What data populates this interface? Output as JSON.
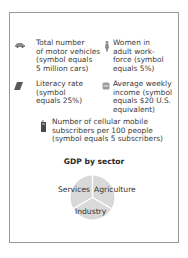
{
  "legend": {
    "items": [
      {
        "icon": "car-icon",
        "text": "Total number\nof motor vehicles\n(symbol equals\n5 million cars)"
      },
      {
        "icon": "woman-icon",
        "text": "Women in\nadult work-\nforce (symbol\nequals 5%)"
      },
      {
        "icon": "book-icon",
        "text": "Literacy rate\n(symbol\nequals 25%)"
      },
      {
        "icon": "money-icon",
        "text": "Average weekly\nincome (symbol\nequals $20 U.S.\nequivalent)"
      },
      {
        "icon": "cellphone-icon",
        "text": "Number of cellular mobile\nsubscribers per 100 people\n(symbol equals 5 subscribers)"
      }
    ]
  },
  "gdp": {
    "title": "GDP by sector",
    "sectors": [
      "Services",
      "Agriculture",
      "Industry"
    ]
  },
  "colors": {
    "border": "#9a9a9a",
    "pie_fill": "#d9d9d9",
    "pie_line": "#ffffff",
    "icon_gray": "#8a8a8a",
    "icon_dark": "#4a4a4a"
  }
}
